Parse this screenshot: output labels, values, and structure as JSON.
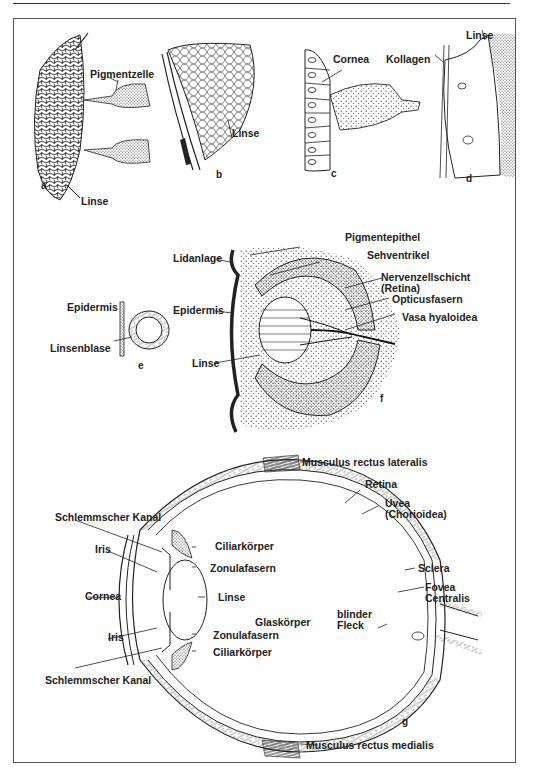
{
  "figure": {
    "panels": {
      "a": {
        "letter": "a",
        "labels": {
          "pigment_cell": "Pigmentzelle",
          "lens": "Linse"
        }
      },
      "b": {
        "letter": "b",
        "labels": {
          "lens": "Linse"
        }
      },
      "c": {
        "letter": "c",
        "labels": {
          "cornea": "Cornea"
        }
      },
      "d": {
        "letter": "d",
        "labels": {
          "lens": "Linse",
          "collagen": "Kollagen"
        }
      },
      "e": {
        "letter": "e",
        "labels": {
          "epidermis": "Epidermis",
          "lens_vesicle": "Linsenblase"
        }
      },
      "f": {
        "letter": "f",
        "labels": {
          "eyelid_primordium": "Lidanlage",
          "epidermis": "Epidermis",
          "lens": "Linse",
          "pigment_epithelium": "Pigmentepithel",
          "optic_ventricle": "Sehventrikel",
          "nerve_cell_layer": "Nervenzellschicht\n(Retina)",
          "optic_fibers": "Opticusfasern",
          "vasa_hyaloidea": "Vasa hyaloidea"
        }
      },
      "g": {
        "letter": "g",
        "labels": {
          "muscle_lateral": "Musculus rectus lateralis",
          "retina": "Retina",
          "uvea": "Uvea\n(Chorioidea)",
          "sclera": "Sclera",
          "fovea": "Fovea\nCentralis",
          "blind_spot": "blinder\nFleck",
          "vitreous": "Glaskörper",
          "schlemm_top": "Schlemmscher Kanal",
          "iris_top": "Iris",
          "ciliary_top": "Ciliarkörper",
          "zonular_top": "Zonulafasern",
          "cornea": "Cornea",
          "lens": "Linse",
          "iris_bottom": "Iris",
          "zonular_bottom": "Zonulafasern",
          "ciliary_bottom": "Ciliarkörper",
          "schlemm_bottom": "Schlemmscher Kanal",
          "muscle_medial": "Musculus rectus medialis"
        }
      }
    }
  }
}
